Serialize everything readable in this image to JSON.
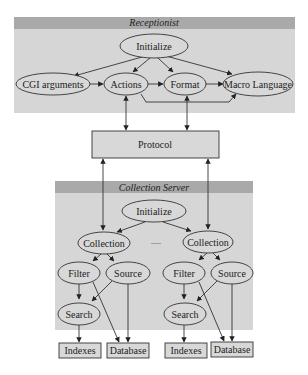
{
  "diagram": {
    "receptionist": {
      "title": "Receptionist",
      "nodes": {
        "initialize": "Initialize",
        "cgi_arguments": "CGI arguments",
        "actions": "Actions",
        "format": "Format",
        "macro_language": "Macro Language"
      }
    },
    "protocol": {
      "label": "Protocol"
    },
    "collection_server": {
      "title": "Collection Server",
      "nodes": {
        "initialize": "Initialize",
        "ellipsis": ".....",
        "left": {
          "collection": "Collection",
          "filter": "Filter",
          "source": "Source",
          "search": "Search"
        },
        "right": {
          "collection": "Collection",
          "filter": "Filter",
          "source": "Source",
          "search": "Search"
        }
      }
    },
    "stores": {
      "left": {
        "indexes": "Indexes",
        "database": "Database"
      },
      "right": {
        "indexes": "Indexes",
        "database": "Database"
      }
    },
    "colors": {
      "panel_fill": "#d6d6d6",
      "header_fill": "#a9a9a9",
      "node_fill": "#d8d8d8",
      "stroke": "#333333"
    }
  }
}
